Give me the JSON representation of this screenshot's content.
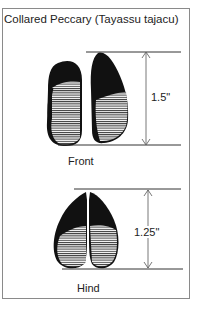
{
  "title": "Collared Peccary (Tayassu tajacu)",
  "front": {
    "label": "Front",
    "measurement": "1.5\""
  },
  "hind": {
    "label": "Hind",
    "measurement": "1.25\""
  },
  "colors": {
    "ink": "#111111",
    "border": "#8a8a8a",
    "background": "#ffffff"
  }
}
